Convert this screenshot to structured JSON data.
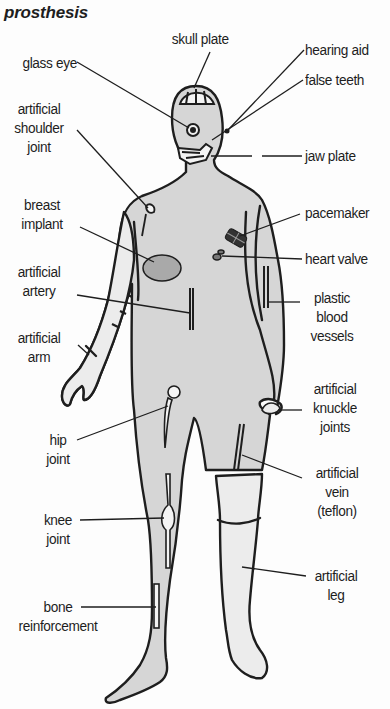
{
  "title": "prosthesis",
  "colors": {
    "body_fill": "#d6d6d6",
    "prosthesis_fill": "#ececec",
    "outline": "#1e1e1e",
    "background": "#fdfdfd"
  },
  "labels": {
    "skull_plate": "skull plate",
    "glass_eye": "glass eye",
    "hearing_aid": "hearing aid",
    "false_teeth": "false teeth",
    "artificial_shoulder_joint": [
      "artificial",
      "shoulder",
      "joint"
    ],
    "jaw_plate": "jaw plate",
    "breast_implant": [
      "breast",
      "implant"
    ],
    "pacemaker": "pacemaker",
    "heart_valve": "heart valve",
    "artificial_artery": [
      "artificial",
      "artery"
    ],
    "plastic_blood_vessels": [
      "plastic",
      "blood",
      "vessels"
    ],
    "artificial_arm": [
      "artificial",
      "arm"
    ],
    "artificial_knuckle_joints": [
      "artificial",
      "knuckle",
      "joints"
    ],
    "hip_joint": [
      "hip",
      "joint"
    ],
    "artificial_vein": [
      "artificial",
      "vein",
      "(teflon)"
    ],
    "knee_joint": [
      "knee",
      "joint"
    ],
    "bone_reinforcement": [
      "bone",
      "reinforcement"
    ],
    "artificial_leg": [
      "artificial",
      "leg"
    ]
  }
}
